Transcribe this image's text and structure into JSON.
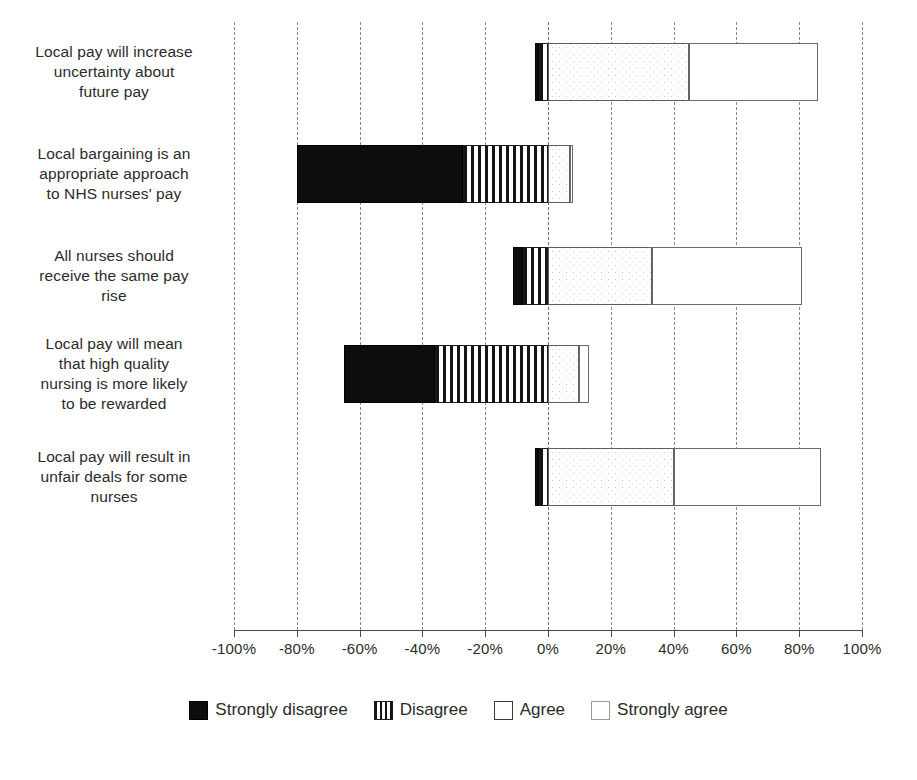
{
  "chart_data": {
    "type": "bar",
    "orientation": "horizontal-diverging-stacked",
    "title": "",
    "xlabel": "",
    "ylabel": "",
    "xlim": [
      -100,
      100
    ],
    "xtick_labels": [
      "-100%",
      "-80%",
      "-60%",
      "-40%",
      "-20%",
      "0%",
      "20%",
      "40%",
      "60%",
      "80%",
      "100%"
    ],
    "xticks": [
      -100,
      -80,
      -60,
      -40,
      -20,
      0,
      20,
      40,
      60,
      80,
      100
    ],
    "grid": true,
    "legend_position": "bottom",
    "categories": [
      "Local pay will increase uncertainty about future pay",
      "Local bargaining is an appropriate approach to NHS nurses' pay",
      "All nurses should receive the same pay rise",
      "Local pay will mean that high quality nursing is more likely to be rewarded",
      "Local pay will result in unfair deals for some nurses"
    ],
    "series": [
      {
        "name": "Strongly disagree",
        "key": "sd",
        "values": [
          -1,
          -53,
          -3,
          -29,
          -1
        ]
      },
      {
        "name": "Disagree",
        "key": "d",
        "values": [
          -3,
          -27,
          -8,
          -36,
          -3
        ]
      },
      {
        "name": "Agree",
        "key": "a",
        "values": [
          45,
          7,
          33,
          10,
          40
        ]
      },
      {
        "name": "Strongly agree",
        "key": "sa",
        "values": [
          41,
          1,
          48,
          3,
          47
        ]
      }
    ]
  },
  "categories_display": [
    [
      "Local pay will increase",
      "uncertainty about",
      "future pay"
    ],
    [
      "Local bargaining is an",
      "appropriate approach",
      "to NHS nurses' pay"
    ],
    [
      "All nurses should",
      "receive the same pay",
      "rise"
    ],
    [
      "Local pay will mean",
      "that high quality",
      "nursing is more likely",
      "to be rewarded"
    ],
    [
      "Local pay will result in",
      "unfair deals for some",
      "nurses"
    ]
  ],
  "legend": {
    "items": [
      {
        "label": "Strongly disagree",
        "key": "sd",
        "color": "#0d0d0d",
        "pattern": "solid-black"
      },
      {
        "label": "Disagree",
        "key": "d",
        "color": "#151515",
        "pattern": "vertical-stripes"
      },
      {
        "label": "Agree",
        "key": "a",
        "color": "#c9c9c9",
        "pattern": "dotted-stipple"
      },
      {
        "label": "Strongly agree",
        "key": "sa",
        "color": "#ffffff",
        "pattern": "empty-white"
      }
    ]
  },
  "axis": {
    "labels": [
      "-100%",
      "-80%",
      "-60%",
      "-40%",
      "-20%",
      "0%",
      "20%",
      "40%",
      "60%",
      "80%",
      "100%"
    ]
  }
}
